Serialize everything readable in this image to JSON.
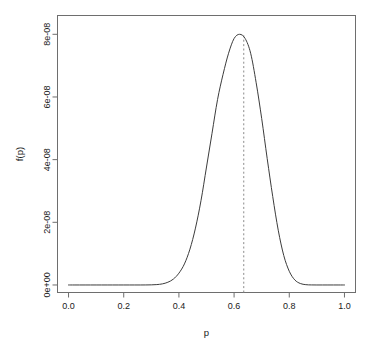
{
  "chart_data": {
    "type": "line",
    "title": "",
    "subtitle": "",
    "xlabel": "p",
    "ylabel": "f(p)",
    "xlim": [
      -0.04,
      1.04
    ],
    "ylim": [
      -2.4e-09,
      8.6e-08
    ],
    "grid": false,
    "legend": null,
    "x_ticks": [
      0.0,
      0.2,
      0.4,
      0.6,
      0.8,
      1.0
    ],
    "x_tick_labels": [
      "0.0",
      "0.2",
      "0.4",
      "0.6",
      "0.8",
      "1.0"
    ],
    "y_ticks": [
      0,
      2e-08,
      4e-08,
      6e-08,
      8e-08
    ],
    "y_tick_labels": [
      "0e+00",
      "2e-08",
      "4e-08",
      "6e-08",
      "8e-08"
    ],
    "series": [
      {
        "name": "f(p)",
        "kind": "curve",
        "color": "#3c3c3c",
        "linestyle": "solid",
        "linewidth": 1,
        "x": [
          0.0,
          0.02,
          0.04,
          0.06,
          0.08,
          0.1,
          0.12,
          0.14,
          0.16,
          0.18,
          0.2,
          0.22,
          0.24,
          0.26,
          0.28,
          0.3,
          0.32,
          0.34,
          0.36,
          0.38,
          0.4,
          0.42,
          0.44,
          0.46,
          0.48,
          0.5,
          0.52,
          0.54,
          0.56,
          0.58,
          0.6,
          0.62,
          0.64,
          0.66,
          0.68,
          0.7,
          0.72,
          0.74,
          0.76,
          0.78,
          0.8,
          0.82,
          0.84,
          0.86,
          0.88,
          0.9,
          0.92,
          0.94,
          0.96,
          0.98,
          1.0
        ],
        "y": [
          0.0,
          0.0,
          0.0,
          0.0,
          0.0,
          0.0,
          0.0,
          0.0,
          1e-14,
          1.4e-13,
          1.5e-12,
          1.2e-11,
          7.6e-11,
          3.9e-10,
          1.7e-09,
          6.1e-09,
          1.9e-08,
          5.2e-08,
          1.3e-07,
          2.8e-07,
          5.6e-07,
          1e-06,
          1.7e-06,
          2.7e-06,
          4e-06,
          5.6e-06,
          7.2e-06,
          8.8e-06,
          1e-05,
          1.1e-05,
          1.17e-05,
          1.19e-05,
          1.17e-05,
          1.1e-05,
          9.6e-06,
          7.9e-06,
          6e-06,
          4.2e-06,
          2.6e-06,
          1.4e-06,
          6.5e-07,
          2.4e-07,
          7e-08,
          1.5e-08,
          2.2e-09,
          2e-10,
          9.6e-12,
          1.8e-13,
          9e-16,
          5e-19,
          0.0
        ],
        "peak_x": 0.635,
        "peak_y": 8e-08
      }
    ],
    "annotations": [
      {
        "kind": "vline",
        "name": "mode-line",
        "x": 0.635,
        "color": "#8a8a8a",
        "linestyle": "dashed",
        "label": ""
      }
    ]
  },
  "axes": {
    "x_title": "p",
    "y_title": "f(p)"
  }
}
